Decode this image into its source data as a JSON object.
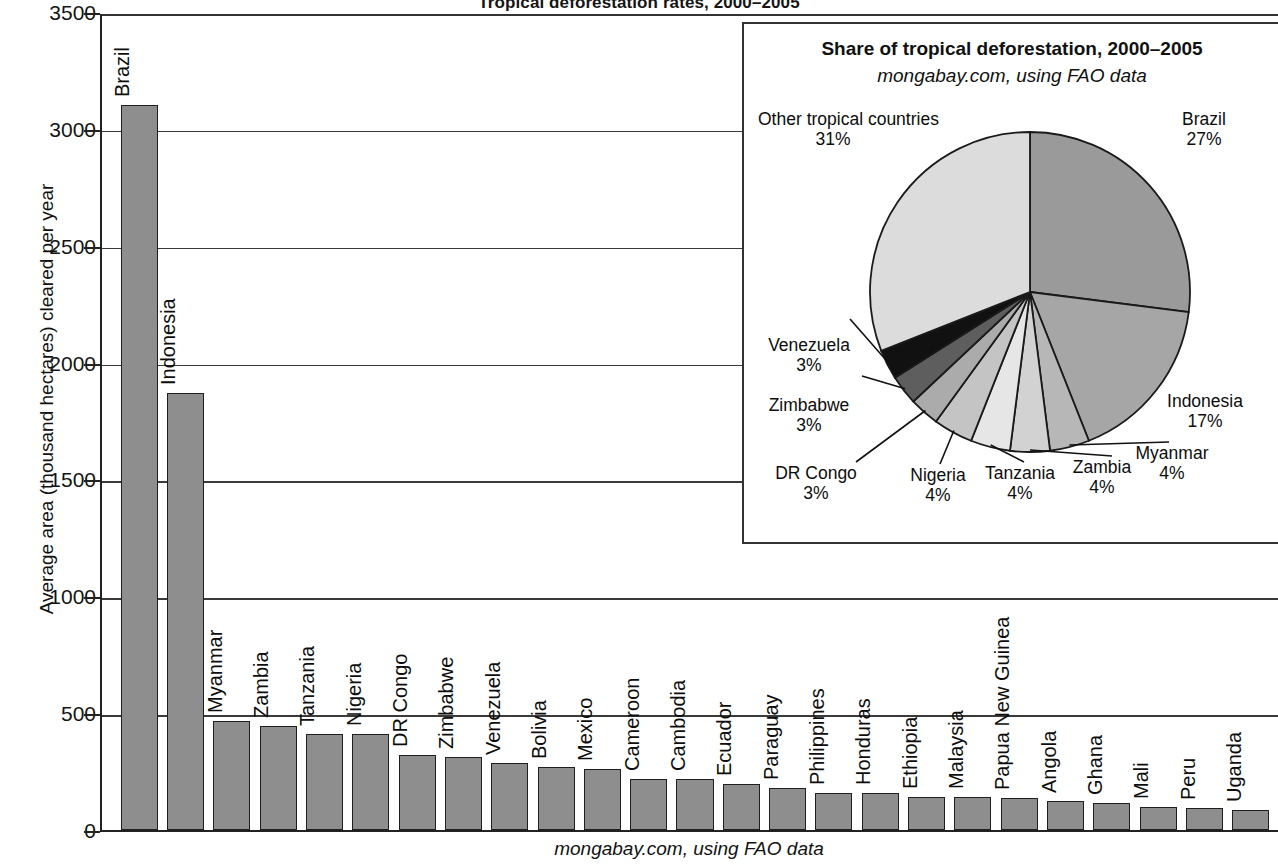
{
  "title": "Tropical deforestation rates, 2000–2005",
  "bottom_caption": "mongabay.com, using FAO data",
  "y_axis_title": "Average area (thousand hectares) cleared per year",
  "inset": {
    "title": "Share of tropical deforestation, 2000–2005",
    "subtitle": "mongabay.com, using FAO data"
  },
  "colors": {
    "bar_fill": "#8e8e8e",
    "bar_stroke": "#1f1f1f",
    "axis": "#222222",
    "grid": "#3a3a3a",
    "text": "#111111"
  },
  "chart_data": [
    {
      "type": "bar",
      "title": "Tropical deforestation rates, 2000–2005",
      "xlabel": "",
      "ylabel": "Average area (thousand hectares) cleared per year",
      "ylim": [
        0,
        3500
      ],
      "yticks": [
        0,
        500,
        1000,
        1500,
        2000,
        2500,
        3000,
        3500
      ],
      "grid": true,
      "legend": "none",
      "source": "mongabay.com, using FAO data",
      "categories": [
        "Brazil",
        "Indonesia",
        "Myanmar",
        "Zambia",
        "Tanzania",
        "Nigeria",
        "DR Congo",
        "Zimbabwe",
        "Venezuela",
        "Bolivia",
        "Mexico",
        "Cameroon",
        "Cambodia",
        "Ecuador",
        "Paraguay",
        "Philippines",
        "Honduras",
        "Ethiopia",
        "Malaysia",
        "Papua New Guinea",
        "Angola",
        "Ghana",
        "Mali",
        "Peru",
        "Uganda"
      ],
      "values": [
        3103,
        1872,
        466,
        445,
        412,
        410,
        319,
        313,
        288,
        270,
        260,
        220,
        217,
        198,
        179,
        157,
        157,
        141,
        140,
        139,
        125,
        115,
        100,
        94,
        86
      ]
    },
    {
      "type": "pie",
      "title": "Share of tropical deforestation, 2000–2005",
      "subtitle": "mongabay.com, using FAO data",
      "source": "mongabay.com, using FAO data",
      "legend": "callout-labels",
      "labels": [
        "Brazil",
        "Indonesia",
        "Myanmar",
        "Zambia",
        "Tanzania",
        "Nigeria",
        "DR Congo",
        "Zimbabwe",
        "Venezuela",
        "Other tropical countries"
      ],
      "values": [
        27,
        17,
        4,
        4,
        4,
        4,
        3,
        3,
        3,
        31
      ],
      "value_labels": [
        "27%",
        "17%",
        "4%",
        "4%",
        "4%",
        "4%",
        "3%",
        "3%",
        "3%",
        "31%"
      ],
      "slice_colors": [
        "#9a9a9a",
        "#a6a6a6",
        "#b7b7b7",
        "#cfcfcf",
        "#e2e2e2",
        "#c4c4c4",
        "#ababab",
        "#5e5e5e",
        "#111111",
        "#dcdcdc"
      ]
    }
  ],
  "bars": [
    {
      "label": "Brazil",
      "value": 3103
    },
    {
      "label": "Indonesia",
      "value": 1872
    },
    {
      "label": "Myanmar",
      "value": 466
    },
    {
      "label": "Zambia",
      "value": 445
    },
    {
      "label": "Tanzania",
      "value": 412
    },
    {
      "label": "Nigeria",
      "value": 410
    },
    {
      "label": "DR Congo",
      "value": 319
    },
    {
      "label": "Zimbabwe",
      "value": 313
    },
    {
      "label": "Venezuela",
      "value": 288
    },
    {
      "label": "Bolivia",
      "value": 270
    },
    {
      "label": "Mexico",
      "value": 260
    },
    {
      "label": "Cameroon",
      "value": 220
    },
    {
      "label": "Cambodia",
      "value": 217
    },
    {
      "label": "Ecuador",
      "value": 198
    },
    {
      "label": "Paraguay",
      "value": 179
    },
    {
      "label": "Philippines",
      "value": 157
    },
    {
      "label": "Honduras",
      "value": 157
    },
    {
      "label": "Ethiopia",
      "value": 141
    },
    {
      "label": "Malaysia",
      "value": 140
    },
    {
      "label": "Papua New Guinea",
      "value": 139
    },
    {
      "label": "Angola",
      "value": 125
    },
    {
      "label": "Ghana",
      "value": 115
    },
    {
      "label": "Mali",
      "value": 100
    },
    {
      "label": "Peru",
      "value": 94
    },
    {
      "label": "Uganda",
      "value": 86
    }
  ],
  "yticks": [
    "3500",
    "3000",
    "2500",
    "2000",
    "1500",
    "1000",
    "500",
    "0"
  ],
  "pie_slices": [
    {
      "label": "Brazil",
      "percent_label": "27%",
      "value": 27,
      "color": "#9a9a9a"
    },
    {
      "label": "Indonesia",
      "percent_label": "17%",
      "value": 17,
      "color": "#a6a6a6"
    },
    {
      "label": "Myanmar",
      "percent_label": "4%",
      "value": 4,
      "color": "#b7b7b7"
    },
    {
      "label": "Zambia",
      "percent_label": "4%",
      "value": 4,
      "color": "#d2d2d2"
    },
    {
      "label": "Tanzania",
      "percent_label": "4%",
      "value": 4,
      "color": "#e6e6e6"
    },
    {
      "label": "Nigeria",
      "percent_label": "4%",
      "value": 4,
      "color": "#c4c4c4"
    },
    {
      "label": "DR Congo",
      "percent_label": "3%",
      "value": 3,
      "color": "#ababab"
    },
    {
      "label": "Zimbabwe",
      "percent_label": "3%",
      "value": 3,
      "color": "#5e5e5e"
    },
    {
      "label": "Venezuela",
      "percent_label": "3%",
      "value": 3,
      "color": "#111111"
    },
    {
      "label": "Other tropical countries",
      "percent_label": "31%",
      "value": 31,
      "color": "#dcdcdc"
    }
  ]
}
